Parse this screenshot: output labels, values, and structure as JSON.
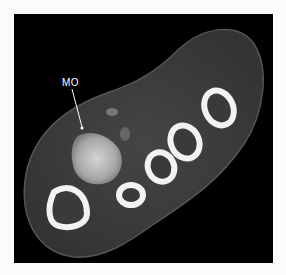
{
  "figure": {
    "type": "CT axial cross-section",
    "annotation": {
      "label": "MO"
    },
    "colors": {
      "background": "#000000",
      "soft_tissue": "#3c3c3c",
      "cortical_bone": "#f2f2f2",
      "marrow": "#3a3a3a",
      "lesion": "#bdbdbd"
    },
    "bones": [
      {
        "name": "bone-1",
        "cx": 53,
        "cy": 193
      },
      {
        "name": "bone-2",
        "cx": 117,
        "cy": 181
      },
      {
        "name": "bone-3",
        "cx": 147,
        "cy": 153
      },
      {
        "name": "bone-4",
        "cx": 171,
        "cy": 128
      },
      {
        "name": "bone-5",
        "cx": 205,
        "cy": 94
      }
    ]
  }
}
